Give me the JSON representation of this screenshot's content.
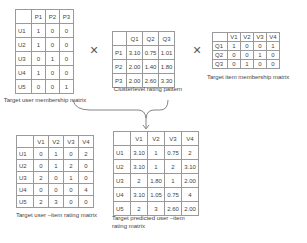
{
  "user_membership": {
    "caption": "Target user membership matrix",
    "columns": [
      "",
      "P1",
      "P2",
      "P3"
    ],
    "rows": [
      [
        "U1",
        "1",
        "0",
        "0"
      ],
      [
        "U2",
        "1",
        "0",
        "0"
      ],
      [
        "U3",
        "0",
        "1",
        "0"
      ],
      [
        "U4",
        "1",
        "0",
        "0"
      ],
      [
        "U5",
        "0",
        "0",
        "1"
      ]
    ]
  },
  "cluster_rating": {
    "caption": "Clusterlevel  rating pattern",
    "columns": [
      "",
      "Q1",
      "Q2",
      "Q3"
    ],
    "rows": [
      [
        "P1",
        "3.10",
        "0.75",
        "1.01"
      ],
      [
        "P2",
        "2.00",
        "1.40",
        "1.80"
      ],
      [
        "P3",
        "2.00",
        "2.60",
        "3.30"
      ]
    ]
  },
  "item_membership": {
    "caption": "Target item membership matrix",
    "columns": [
      "",
      "V1",
      "V2",
      "V3",
      "V4"
    ],
    "rows": [
      [
        "Q1",
        "1",
        "0",
        "0",
        "1"
      ],
      [
        "Q2",
        "0",
        "0",
        "1",
        "0"
      ],
      [
        "Q3",
        "0",
        "1",
        "0",
        "0"
      ]
    ]
  },
  "user_item_rating": {
    "caption": "Target  user –item rating  matrix",
    "columns": [
      "",
      "V1",
      "V2",
      "V3",
      "V4"
    ],
    "rows": [
      [
        "U1",
        "0",
        "1",
        "0",
        "2"
      ],
      [
        "U2",
        "0",
        "1",
        "2",
        "0"
      ],
      [
        "U3",
        "2",
        "0",
        "1",
        "0"
      ],
      [
        "U4",
        "0",
        "0",
        "0",
        "4"
      ],
      [
        "U5",
        "2",
        "3",
        "0",
        "0"
      ]
    ]
  },
  "predicted_rating": {
    "caption_line1": "Target  predicted user –item",
    "caption_line2": "rating  matrix",
    "columns": [
      "",
      "V1",
      "V2",
      "V3",
      "V4"
    ],
    "rows": [
      [
        "U1",
        "3.10",
        "1",
        "0.75",
        "2"
      ],
      [
        "U2",
        "3.10",
        "1",
        "2",
        "3.10"
      ],
      [
        "U3",
        "2",
        "1.80",
        "1",
        "2.00"
      ],
      [
        "U4",
        "3.10",
        "1.05",
        "0.75",
        "4"
      ],
      [
        "U5",
        "2",
        "3",
        "2.60",
        "2.00"
      ]
    ]
  },
  "operators": {
    "multiply_1": "×",
    "multiply_2": "×"
  }
}
